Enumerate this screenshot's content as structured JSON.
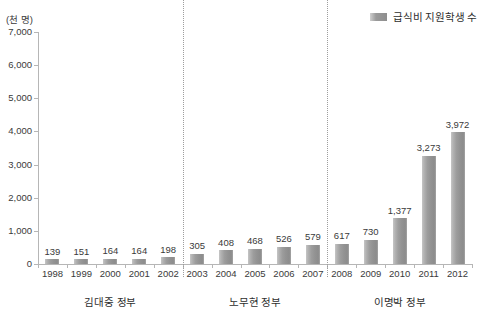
{
  "chart_data": {
    "type": "bar",
    "title": "",
    "unit_label": "(천 명)",
    "xlabel": "",
    "ylabel": "",
    "ylim": [
      0,
      7000
    ],
    "ytick_values": [
      0,
      1000,
      2000,
      3000,
      4000,
      5000,
      6000,
      7000
    ],
    "ytick_labels": [
      "0",
      "1,000",
      "2,000",
      "3,000",
      "4,000",
      "5,000",
      "6,000",
      "7,000"
    ],
    "grid": false,
    "legend_position": "top-right",
    "legend": [
      {
        "name": "급식비 지원학생 수",
        "color": "#9a9a9a"
      }
    ],
    "categories": [
      "1998",
      "1999",
      "2000",
      "2001",
      "2002",
      "2003",
      "2004",
      "2005",
      "2006",
      "2007",
      "2008",
      "2009",
      "2010",
      "2011",
      "2012"
    ],
    "values": [
      139,
      151,
      164,
      164,
      198,
      305,
      408,
      468,
      526,
      579,
      617,
      730,
      1377,
      3273,
      3972
    ],
    "value_labels": [
      "139",
      "151",
      "164",
      "164",
      "198",
      "305",
      "408",
      "468",
      "526",
      "579",
      "617",
      "730",
      "1,377",
      "3,273",
      "3,972"
    ],
    "series": [
      {
        "name": "급식비 지원학생 수",
        "values": [
          139,
          151,
          164,
          164,
          198,
          305,
          408,
          468,
          526,
          579,
          617,
          730,
          1377,
          3273,
          3972
        ]
      }
    ],
    "groups": [
      {
        "label": "김대중 정부",
        "start_index": 0,
        "end_index": 4
      },
      {
        "label": "노무현 정부",
        "start_index": 5,
        "end_index": 9
      },
      {
        "label": "이명박 정부",
        "start_index": 10,
        "end_index": 14
      }
    ],
    "dividers_after_index": [
      4,
      9
    ]
  }
}
